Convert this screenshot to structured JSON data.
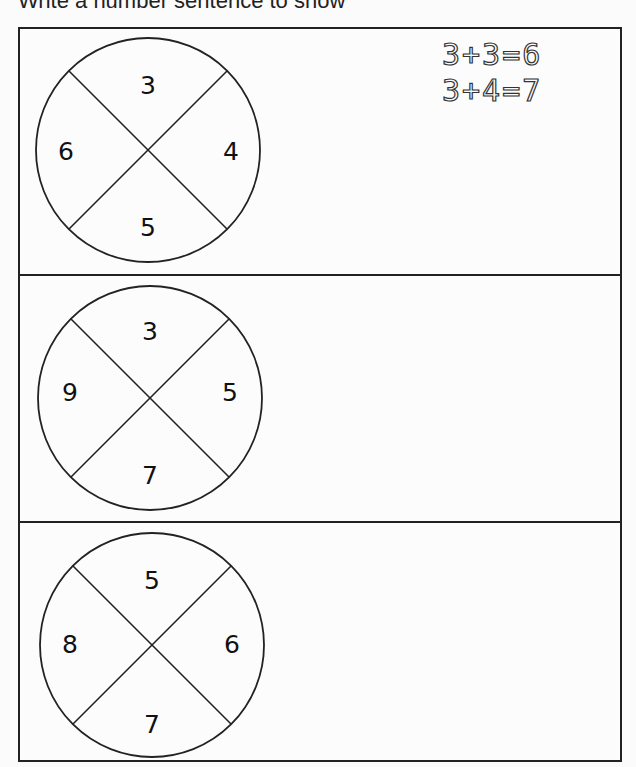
{
  "worksheet": {
    "instruction": "Write a number sentence to show",
    "problems": [
      {
        "wheel": {
          "top": "3",
          "right": "4",
          "bottom": "5",
          "left": "6"
        },
        "example_sentences": [
          "3+3=6",
          "3+4=7"
        ]
      },
      {
        "wheel": {
          "top": "3",
          "right": "5",
          "bottom": "7",
          "left": "9"
        },
        "example_sentences": []
      },
      {
        "wheel": {
          "top": "5",
          "right": "6",
          "bottom": "7",
          "left": "8"
        },
        "example_sentences": []
      }
    ]
  }
}
